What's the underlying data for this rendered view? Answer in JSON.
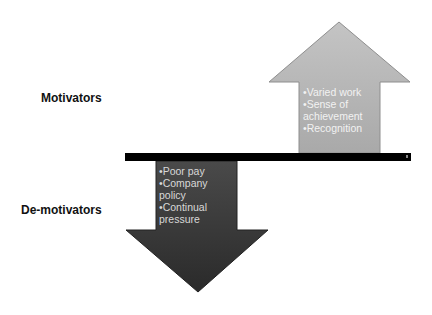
{
  "labels": {
    "top": "Motivators",
    "bottom": "De-motivators"
  },
  "up_arrow": {
    "direction": "up",
    "color": "#b3b3b3",
    "items": [
      "•Varied work",
      "•Sense of",
      "achievement",
      "•Recognition"
    ]
  },
  "down_arrow": {
    "direction": "down",
    "color": "#3a3a3a",
    "items": [
      "•Poor pay",
      "•Company",
      "policy",
      "•Continual",
      "pressure"
    ]
  },
  "divider": {
    "color": "#000000"
  }
}
